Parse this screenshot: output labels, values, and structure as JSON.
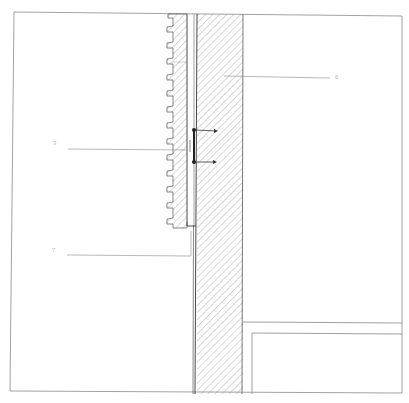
{
  "drawing": {
    "type": "section detail",
    "colors": {
      "line": "#555555",
      "hatch": "#777777",
      "frame": "#888888",
      "leader": "#9a9a9a",
      "label": "#b8b8b8"
    },
    "callouts": [
      {
        "id": "callout-6",
        "label": "6",
        "target": "wall"
      },
      {
        "id": "callout-3",
        "label": "3",
        "target": "cladding-panel"
      },
      {
        "id": "callout-7",
        "label": "7",
        "target": "base-profile"
      }
    ]
  }
}
